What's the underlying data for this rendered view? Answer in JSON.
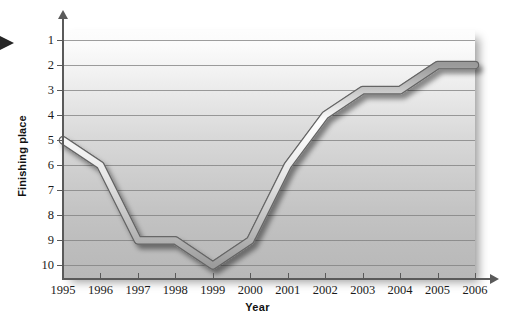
{
  "chart_data": {
    "type": "line",
    "title": "",
    "xlabel": "Year",
    "ylabel": "Finishing place",
    "categories": [
      "1995",
      "1996",
      "1997",
      "1998",
      "1999",
      "2000",
      "2001",
      "2002",
      "2003",
      "2004",
      "2005",
      "2006"
    ],
    "x": [
      1995,
      1996,
      1997,
      1998,
      1999,
      2000,
      2001,
      2002,
      2003,
      2004,
      2005,
      2006
    ],
    "values": [
      5,
      6,
      9,
      9,
      10,
      9,
      6,
      4,
      3,
      3,
      2,
      2
    ],
    "series": [
      {
        "name": "Finishing place",
        "values": [
          5,
          6,
          9,
          9,
          10,
          9,
          6,
          4,
          3,
          3,
          2,
          2
        ]
      }
    ],
    "ytick_labels": [
      "1",
      "2",
      "3",
      "4",
      "5",
      "6",
      "7",
      "8",
      "9",
      "10"
    ],
    "yticks": [
      1,
      2,
      3,
      4,
      5,
      6,
      7,
      8,
      9,
      10
    ],
    "ylim": [
      10.5,
      0.6
    ],
    "y_axis_inverted": true,
    "xlim": [
      1995,
      2006
    ],
    "grid": true,
    "grid_axis": "y",
    "legend": false,
    "legend_position": "none",
    "annotations": [],
    "style": {
      "line_color": "#f2f2f2",
      "line_outline_color": "#6b6b6b",
      "plot_bg_top": "#fdfdfd",
      "plot_bg_bottom": "#b8b8b8",
      "gridline_color": "#7d7d7d",
      "axis_color": "#5a5a5a",
      "text_color": "#1b1b1b",
      "marker_color": "#262626"
    }
  },
  "markers": {
    "left_pointer": "left-pointer-triangle"
  }
}
